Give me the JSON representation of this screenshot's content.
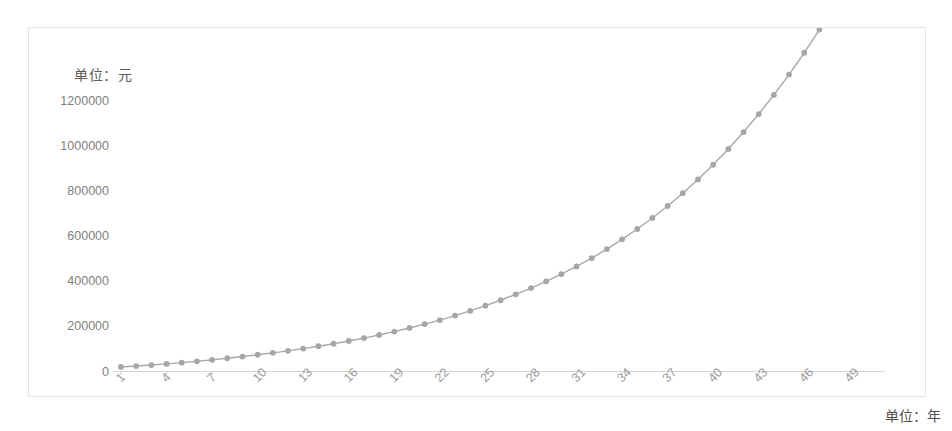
{
  "chart_data": {
    "type": "line",
    "title": "",
    "subtitle": "",
    "xlabel": "单位：年",
    "ylabel": "单位：元",
    "ylim": [
      0,
      1260000
    ],
    "xlim": [
      1,
      50
    ],
    "grid": false,
    "legend": null,
    "legend_position": "none",
    "marker": "circle",
    "line_color": "#a8a8a8",
    "marker_color": "#a6a6a6",
    "ytick_labels": [
      "0",
      "200000",
      "400000",
      "600000",
      "800000",
      "1000000",
      "1200000"
    ],
    "ytick_values": [
      0,
      200000,
      400000,
      600000,
      800000,
      1000000,
      1200000
    ],
    "xtick_labels": [
      "1",
      "4",
      "7",
      "10",
      "13",
      "16",
      "19",
      "22",
      "25",
      "28",
      "31",
      "34",
      "37",
      "40",
      "43",
      "46",
      "49"
    ],
    "xtick_values": [
      1,
      4,
      7,
      10,
      13,
      16,
      19,
      22,
      25,
      28,
      31,
      34,
      37,
      40,
      43,
      46,
      49
    ],
    "xtick_rotation": 45,
    "x": [
      1,
      2,
      3,
      4,
      5,
      6,
      7,
      8,
      9,
      10,
      11,
      12,
      13,
      14,
      15,
      16,
      17,
      18,
      19,
      20,
      21,
      22,
      23,
      24,
      25,
      26,
      27,
      28,
      29,
      30,
      31,
      32,
      33,
      34,
      35,
      36,
      37,
      38,
      39,
      40,
      41,
      42,
      43,
      44,
      45,
      46,
      47,
      48,
      49,
      50
    ],
    "values": [
      12000,
      25440,
      40493,
      57352,
      76234,
      97382,
      121068,
      147595,
      177306,
      210583,
      247853,
      289595,
      336347,
      388709,
      447354,
      513036,
      586600,
      668992,
      761271,
      864624,
      980379,
      1110025,
      1255228,
      1417855,
      1599998,
      1804000,
      2032000,
      2286000,
      2571000,
      2890000,
      3248000,
      3650000,
      4100000,
      4605000,
      5171000,
      5808000,
      6521000,
      7324000,
      8225000,
      9238000,
      10375000,
      11652000,
      13086000,
      14698000,
      16510000,
      18547000,
      20839000,
      23418000,
      26322000,
      29593000
    ],
    "plot_values": [
      18000,
      22000,
      26500,
      31500,
      37000,
      43000,
      49500,
      56500,
      64000,
      72000,
      80500,
      89500,
      99500,
      110000,
      121000,
      133000,
      146000,
      160000,
      175000,
      191000,
      208000,
      226000,
      246000,
      267000,
      290000,
      314000,
      340000,
      368000,
      398000,
      430000,
      464000,
      501000,
      541000,
      584000,
      630000,
      679000,
      732000,
      789000,
      850000,
      915000,
      985000,
      1060000,
      1140000,
      1225000,
      1315000,
      1412000,
      1515000,
      1625000,
      1742000,
      1866000
    ]
  },
  "labels": {
    "unit_y": "单位：元",
    "unit_x": "单位：年"
  }
}
